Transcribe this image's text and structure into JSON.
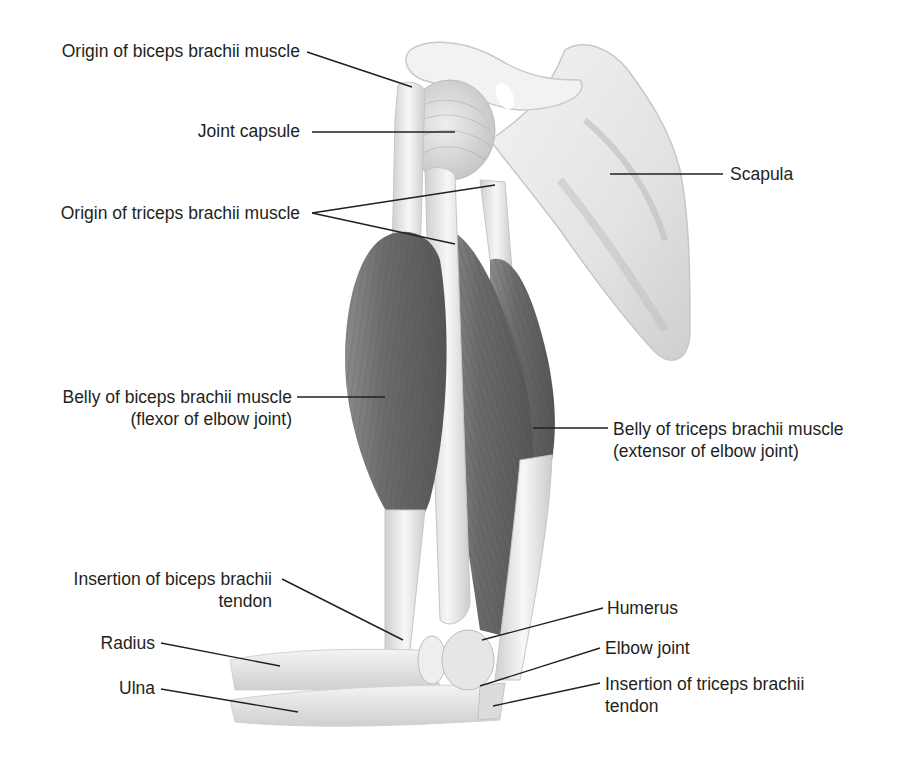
{
  "figure": {
    "colors": {
      "background": "#ffffff",
      "bone": "#ececec",
      "bone_shadow": "#bdbdbd",
      "muscle": "#6e6e6e",
      "muscle_dark": "#4f4f4f",
      "tendon": "#d9d9d9",
      "leader_line": "#231f20",
      "text": "#231f20"
    },
    "labels": {
      "origin_biceps": {
        "text": "Origin of biceps brachii muscle"
      },
      "joint_capsule": {
        "text": "Joint capsule"
      },
      "origin_triceps": {
        "text": "Origin of triceps brachii muscle"
      },
      "scapula": {
        "text": "Scapula"
      },
      "belly_biceps": {
        "line1": "Belly of biceps brachii muscle",
        "line2": "(flexor of elbow joint)"
      },
      "belly_triceps": {
        "line1": "Belly of triceps brachii muscle",
        "line2": "(extensor of elbow joint)"
      },
      "insertion_biceps": {
        "line1": "Insertion of biceps brachii",
        "line2": "tendon"
      },
      "radius": {
        "text": "Radius"
      },
      "ulna": {
        "text": "Ulna"
      },
      "humerus": {
        "text": "Humerus"
      },
      "elbow_joint": {
        "text": "Elbow joint"
      },
      "insertion_triceps": {
        "line1": "Insertion of triceps brachii",
        "line2": "tendon"
      }
    }
  }
}
